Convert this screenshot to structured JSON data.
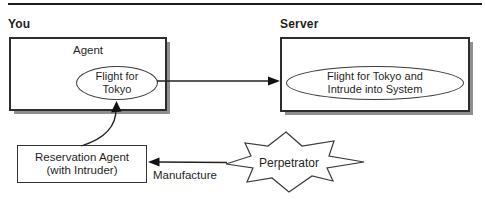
{
  "figure": {
    "top_rule": true,
    "regions": {
      "client_label": "You",
      "server_label": "Server"
    },
    "agent_box": {
      "title": "Agent",
      "ellipse_text": "Flight for\nTokyo"
    },
    "server_box": {
      "ellipse_text": "Flight for Tokyo and\nIntrude into System"
    },
    "reservation_box": {
      "line1": "Reservation Agent",
      "line2": "(with Intruder)"
    },
    "perpetrator": {
      "label": "Perpetrator"
    },
    "arrows": {
      "manufacture_label": "Manufacture"
    },
    "colors": {
      "ink": "#1f1f1f",
      "border": "#2d2d2d",
      "shadow": "#8f8f8f",
      "background": "#ffffff"
    }
  }
}
